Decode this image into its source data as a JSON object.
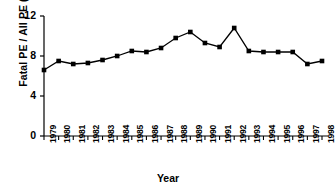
{
  "chart_data": {
    "type": "line",
    "title": "",
    "xlabel": "Year",
    "ylabel": "Fatal PE / All PE (%)",
    "categories": [
      "1979",
      "1980",
      "1981",
      "1982",
      "1983",
      "1984",
      "1985",
      "1986",
      "1987",
      "1988",
      "1989",
      "1990",
      "1991",
      "1992",
      "1993",
      "1994",
      "1995",
      "1996",
      "1997",
      "1998"
    ],
    "values": [
      6.6,
      7.5,
      7.2,
      7.3,
      7.6,
      8.0,
      8.5,
      8.4,
      8.8,
      9.8,
      10.4,
      9.3,
      8.9,
      10.8,
      8.5,
      8.4,
      8.4,
      8.4,
      7.2,
      7.5
    ],
    "x": [
      1979,
      1980,
      1981,
      1982,
      1983,
      1984,
      1985,
      1986,
      1987,
      1988,
      1989,
      1990,
      1991,
      1992,
      1993,
      1994,
      1995,
      1996,
      1997,
      1998
    ],
    "ylim": [
      0,
      12
    ],
    "yticks": [
      0,
      4,
      8,
      12
    ],
    "ytick_labels": [
      "0",
      "4",
      "8",
      "12"
    ],
    "grid": false,
    "legend": false,
    "marker": "square",
    "series_color": "#000000",
    "line_color": "#000000",
    "background_color": "#ffffff"
  }
}
